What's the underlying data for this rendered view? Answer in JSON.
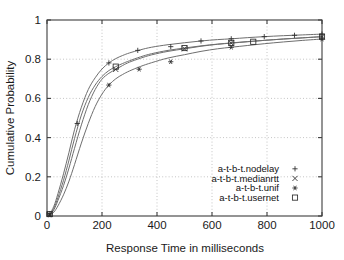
{
  "chart_data": {
    "type": "line",
    "title": "",
    "xlabel": "Response Time in milliseconds",
    "ylabel": "Cumulative Probability",
    "xlim": [
      0,
      1000
    ],
    "ylim": [
      0,
      1
    ],
    "xticks": [
      0,
      200,
      400,
      600,
      800,
      1000
    ],
    "yticks": [
      0,
      0.2,
      0.4,
      0.6,
      0.8,
      1
    ],
    "xtick_labels": [
      "0",
      "200",
      "400",
      "600",
      "800",
      "1000"
    ],
    "ytick_labels": [
      "0",
      "0.2",
      "0.4",
      "0.6",
      "0.8",
      "1"
    ],
    "grid": true,
    "grid_style": "dotted",
    "legend_position": "bottom-right",
    "line_color": "#6e6e6e",
    "marker_color": "#2b2b2b",
    "axis_color": "#3d3d3d",
    "background": "#ffffff",
    "series": [
      {
        "name": "a-t-b-t.nodelay",
        "marker": "plus",
        "marker_glyph": "+",
        "x": [
          0,
          10,
          25,
          40,
          60,
          80,
          100,
          125,
          150,
          175,
          200,
          225,
          250,
          275,
          300,
          340,
          380,
          440,
          500,
          560,
          620,
          670,
          730,
          790,
          860,
          930,
          1000
        ],
        "y": [
          0,
          0.012,
          0.05,
          0.115,
          0.215,
          0.325,
          0.44,
          0.555,
          0.645,
          0.705,
          0.75,
          0.781,
          0.803,
          0.819,
          0.832,
          0.848,
          0.861,
          0.874,
          0.884,
          0.893,
          0.9,
          0.904,
          0.91,
          0.915,
          0.92,
          0.924,
          0.928
        ],
        "marker_x": [
          10,
          110,
          225,
          330,
          450,
          560,
          670,
          790,
          900,
          1000
        ],
        "marker_y": [
          0.012,
          0.472,
          0.781,
          0.845,
          0.864,
          0.893,
          0.904,
          0.915,
          0.922,
          0.928
        ]
      },
      {
        "name": "a-t-b-t.medianrtt",
        "marker": "cross",
        "marker_glyph": "×",
        "x": [
          0,
          10,
          25,
          40,
          60,
          80,
          100,
          125,
          150,
          175,
          200,
          225,
          250,
          275,
          300,
          340,
          380,
          440,
          500,
          560,
          620,
          670,
          730,
          790,
          860,
          930,
          1000
        ],
        "y": [
          0,
          0.008,
          0.032,
          0.08,
          0.155,
          0.245,
          0.345,
          0.465,
          0.568,
          0.645,
          0.698,
          0.728,
          0.748,
          0.768,
          0.785,
          0.805,
          0.822,
          0.84,
          0.853,
          0.866,
          0.876,
          0.882,
          0.889,
          0.896,
          0.903,
          0.909,
          0.915
        ],
        "marker_x": [
          10,
          250,
          500,
          670,
          1000
        ],
        "marker_y": [
          0.008,
          0.748,
          0.853,
          0.882,
          0.915
        ]
      },
      {
        "name": "a-t-b-t.unif",
        "marker": "asterisk",
        "marker_glyph": "✱",
        "x": [
          0,
          10,
          25,
          40,
          60,
          80,
          100,
          125,
          150,
          175,
          200,
          225,
          250,
          275,
          300,
          340,
          380,
          440,
          500,
          560,
          620,
          670,
          730,
          790,
          860,
          930,
          1000
        ],
        "y": [
          0,
          0.005,
          0.02,
          0.052,
          0.108,
          0.178,
          0.262,
          0.372,
          0.472,
          0.558,
          0.622,
          0.668,
          0.7,
          0.722,
          0.74,
          0.763,
          0.782,
          0.806,
          0.823,
          0.84,
          0.853,
          0.861,
          0.87,
          0.879,
          0.888,
          0.896,
          0.903
        ],
        "marker_x": [
          10,
          225,
          335,
          450,
          670,
          1000
        ],
        "marker_y": [
          0.005,
          0.668,
          0.749,
          0.787,
          0.861,
          0.903
        ]
      },
      {
        "name": "a-t-b-t.usernet",
        "marker": "square",
        "marker_glyph": "□",
        "x": [
          0,
          10,
          25,
          40,
          60,
          80,
          100,
          125,
          150,
          175,
          200,
          225,
          250,
          275,
          300,
          340,
          380,
          440,
          500,
          560,
          620,
          670,
          730,
          790,
          860,
          930,
          1000
        ],
        "y": [
          0,
          0.01,
          0.04,
          0.095,
          0.182,
          0.285,
          0.395,
          0.515,
          0.605,
          0.668,
          0.712,
          0.742,
          0.762,
          0.778,
          0.792,
          0.812,
          0.828,
          0.845,
          0.857,
          0.868,
          0.877,
          0.883,
          0.89,
          0.896,
          0.903,
          0.909,
          0.915
        ],
        "marker_x": [
          10,
          250,
          500,
          670,
          750,
          1000
        ],
        "marker_y": [
          0.01,
          0.762,
          0.857,
          0.883,
          0.889,
          0.915
        ]
      }
    ]
  },
  "legend": {
    "entries": [
      {
        "label": "a-t-b-t.nodelay",
        "marker": "plus"
      },
      {
        "label": "a-t-b-t.medianrtt",
        "marker": "cross"
      },
      {
        "label": "a-t-b-t.unif",
        "marker": "asterisk"
      },
      {
        "label": "a-t-b-t.usernet",
        "marker": "square"
      }
    ]
  }
}
